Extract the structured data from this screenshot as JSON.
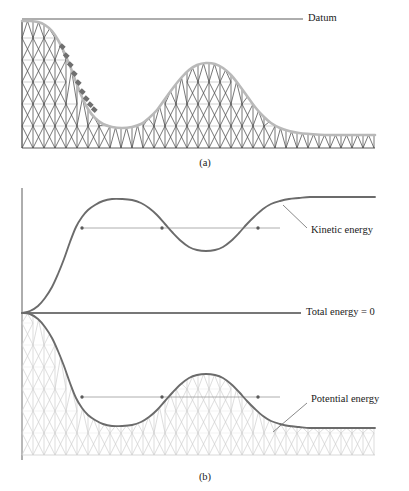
{
  "figure": {
    "panels": [
      {
        "id": "a",
        "caption": "(a)",
        "caption_x": 205,
        "caption_y": 166
      },
      {
        "id": "b",
        "caption": "(b)",
        "caption_y": 480,
        "caption_x": 205
      }
    ]
  },
  "colors": {
    "track": "#b9b9b9",
    "lattice_dark": "#4a4a4a",
    "lattice_light": "#cfcfcf",
    "curve": "#6b6b6b",
    "axis": "#4a4a4a",
    "leader": "#6b6b6b",
    "text": "#1a1a1a",
    "datum": "#4a4a4a",
    "marker": "#5a5a5a",
    "cars": "#6f6f6f",
    "level_line": "#9a9a9a"
  },
  "panel_a": {
    "datum": {
      "label": "Datum",
      "label_x": 308,
      "label_y": 19,
      "line_x1": 22,
      "line_x2": 303,
      "y": 19
    },
    "geometry": {
      "x_left": 22,
      "x_right": 375,
      "y_base": 148,
      "y_top": 21,
      "track_points": [
        [
          22,
          21
        ],
        [
          30,
          21
        ],
        [
          38,
          22
        ],
        [
          45,
          25
        ],
        [
          52,
          31
        ],
        [
          58,
          40
        ],
        [
          64,
          52
        ],
        [
          70,
          66
        ],
        [
          76,
          82
        ],
        [
          82,
          97
        ],
        [
          88,
          109
        ],
        [
          95,
          118
        ],
        [
          103,
          124
        ],
        [
          112,
          127
        ],
        [
          122,
          128
        ],
        [
          132,
          127
        ],
        [
          141,
          124
        ],
        [
          149,
          118
        ],
        [
          157,
          110
        ],
        [
          165,
          99
        ],
        [
          173,
          88
        ],
        [
          181,
          78
        ],
        [
          189,
          70
        ],
        [
          197,
          65
        ],
        [
          206,
          63
        ],
        [
          215,
          64
        ],
        [
          223,
          68
        ],
        [
          231,
          75
        ],
        [
          239,
          85
        ],
        [
          247,
          96
        ],
        [
          255,
          107
        ],
        [
          263,
          116
        ],
        [
          271,
          123
        ],
        [
          280,
          128
        ],
        [
          289,
          131
        ],
        [
          299,
          133
        ],
        [
          310,
          134
        ],
        [
          325,
          135
        ],
        [
          345,
          135
        ],
        [
          375,
          135
        ]
      ]
    },
    "cars": {
      "label": "roller-coaster-train",
      "count": 9,
      "positions": [
        [
          62,
          47
        ],
        [
          66,
          56
        ],
        [
          70,
          65
        ],
        [
          74,
          74
        ],
        [
          78,
          83
        ],
        [
          82,
          92
        ],
        [
          86,
          99
        ],
        [
          90,
          105
        ],
        [
          94,
          110
        ]
      ]
    }
  },
  "panel_b": {
    "axis": {
      "x": 22,
      "y_top": 188,
      "y_bottom": 460
    },
    "origin": {
      "x": 22,
      "y": 313
    },
    "total_energy": {
      "label": "Total energy = 0",
      "label_x": 306,
      "label_y": 313,
      "line_x1": 22,
      "line_x2": 301,
      "y": 313
    },
    "kinetic": {
      "label": "Kinetic energy",
      "label_x": 311,
      "label_y": 231,
      "leader": {
        "x1": 307,
        "y1": 228,
        "x2": 283,
        "y2": 205
      },
      "points": [
        [
          22,
          313
        ],
        [
          30,
          311
        ],
        [
          38,
          306
        ],
        [
          45,
          298
        ],
        [
          52,
          287
        ],
        [
          58,
          274
        ],
        [
          64,
          259
        ],
        [
          70,
          242
        ],
        [
          76,
          227
        ],
        [
          82,
          217
        ],
        [
          88,
          210
        ],
        [
          95,
          205
        ],
        [
          103,
          201
        ],
        [
          112,
          199
        ],
        [
          122,
          199
        ],
        [
          132,
          200
        ],
        [
          141,
          203
        ],
        [
          149,
          208
        ],
        [
          157,
          215
        ],
        [
          165,
          224
        ],
        [
          173,
          233
        ],
        [
          181,
          241
        ],
        [
          189,
          247
        ],
        [
          197,
          250
        ],
        [
          206,
          251
        ],
        [
          215,
          250
        ],
        [
          223,
          247
        ],
        [
          231,
          241
        ],
        [
          239,
          233
        ],
        [
          247,
          224
        ],
        [
          255,
          216
        ],
        [
          263,
          209
        ],
        [
          271,
          204
        ],
        [
          280,
          201
        ],
        [
          289,
          199
        ],
        [
          299,
          198
        ],
        [
          310,
          197
        ],
        [
          325,
          197
        ],
        [
          345,
          197
        ],
        [
          375,
          197
        ]
      ],
      "level_line": {
        "y": 228,
        "x1": 82,
        "x2": 280
      },
      "markers": [
        [
          82,
          228
        ],
        [
          162,
          228
        ],
        [
          258,
          228
        ]
      ]
    },
    "potential": {
      "label": "Potential energy",
      "label_x": 311,
      "label_y": 400,
      "leader": {
        "x1": 307,
        "y1": 403,
        "x2": 273,
        "y2": 432
      },
      "points": [
        [
          22,
          313
        ],
        [
          30,
          314
        ],
        [
          38,
          319
        ],
        [
          45,
          327
        ],
        [
          52,
          338
        ],
        [
          58,
          351
        ],
        [
          64,
          366
        ],
        [
          70,
          383
        ],
        [
          76,
          398
        ],
        [
          82,
          408
        ],
        [
          88,
          415
        ],
        [
          95,
          420
        ],
        [
          103,
          424
        ],
        [
          112,
          426
        ],
        [
          122,
          426
        ],
        [
          132,
          425
        ],
        [
          141,
          422
        ],
        [
          149,
          417
        ],
        [
          157,
          410
        ],
        [
          165,
          401
        ],
        [
          173,
          392
        ],
        [
          181,
          384
        ],
        [
          189,
          378
        ],
        [
          197,
          375
        ],
        [
          206,
          374
        ],
        [
          215,
          375
        ],
        [
          223,
          378
        ],
        [
          231,
          384
        ],
        [
          239,
          392
        ],
        [
          247,
          401
        ],
        [
          255,
          409
        ],
        [
          263,
          416
        ],
        [
          271,
          421
        ],
        [
          280,
          424
        ],
        [
          289,
          426
        ],
        [
          299,
          427
        ],
        [
          310,
          428
        ],
        [
          325,
          428
        ],
        [
          345,
          428
        ],
        [
          375,
          428
        ]
      ],
      "baseline_y": 455,
      "level_line": {
        "y": 397,
        "x1": 82,
        "x2": 280
      },
      "markers": [
        [
          82,
          397
        ],
        [
          162,
          397
        ],
        [
          258,
          397
        ]
      ]
    }
  }
}
